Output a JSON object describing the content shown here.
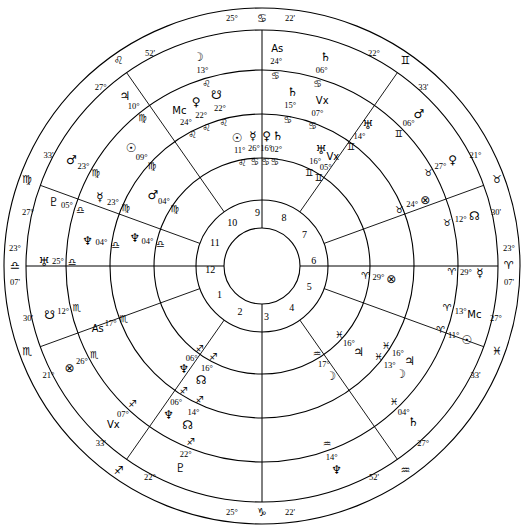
{
  "chart_data": {
    "type": "astrological-wheel",
    "structure": {
      "rings": [
        "outer-sign-ring",
        "outer-wheel",
        "middle-wheel",
        "inner-wheel",
        "house-number-ring",
        "center"
      ],
      "house_count": 12,
      "grid": false,
      "legend": "none"
    },
    "glyphs": {
      "aries": "♈",
      "taurus": "♉",
      "gemini": "♊",
      "cancer": "♋",
      "leo": "♌",
      "virgo": "♍",
      "libra": "♎",
      "scorpio": "♏",
      "sagittarius": "♐",
      "capricorn": "♑",
      "aquarius": "♒",
      "pisces": "♓",
      "sun": "☉",
      "moon": "☽",
      "mercury": "☿",
      "venus": "♀",
      "mars": "♂",
      "jupiter": "♃",
      "saturn": "♄",
      "uranus": "♅",
      "neptune": "♆",
      "pluto": "♇",
      "node_north": "☊",
      "node_south": "☋",
      "fortune": "⊗",
      "vertex": "Vx",
      "asc": "As",
      "mc": "Mc"
    },
    "angles": {
      "ascendant": {
        "label": "As",
        "deg": "25",
        "sign": "cancer",
        "min": "22'",
        "position": "top"
      },
      "descendant": {
        "deg": "23",
        "sign": "libra",
        "min": "07'",
        "position": "left"
      },
      "mc_outer": {
        "deg": "23",
        "sign": "aries",
        "min": "07'",
        "position": "right"
      },
      "ic": {
        "deg": "25",
        "sign": "capricorn",
        "min": "22'",
        "position": "bottom"
      }
    },
    "cusp_labels": [
      {
        "deg": "25",
        "sign": "cancer",
        "min": "22'",
        "angle_deg": 90
      },
      {
        "deg": "22",
        "sign": "gemini",
        "min": "33'",
        "angle_deg": 55
      },
      {
        "deg": "21",
        "sign": "taurus",
        "min": "30'",
        "angle_deg": 20
      },
      {
        "deg": "23",
        "sign": "aries",
        "min": "07'",
        "angle_deg": 0
      },
      {
        "deg": "27",
        "sign": "pisces",
        "min": "33'",
        "angle_deg": -20
      },
      {
        "deg": "27",
        "sign": "aquarius",
        "min": "52'",
        "angle_deg": -55
      },
      {
        "deg": "25",
        "sign": "capricorn",
        "min": "22'",
        "angle_deg": -90
      },
      {
        "deg": "22",
        "sign": "sagittarius",
        "min": "33'",
        "angle_deg": -125
      },
      {
        "deg": "21",
        "sign": "scorpio",
        "min": "30'",
        "angle_deg": -160
      },
      {
        "deg": "23",
        "sign": "libra",
        "min": "07'",
        "angle_deg": 180
      },
      {
        "deg": "27",
        "sign": "virgo",
        "min": "33'",
        "angle_deg": 160
      },
      {
        "deg": "27",
        "sign": "leo",
        "min": "52'",
        "angle_deg": 125
      }
    ],
    "house_numbers": [
      "1",
      "2",
      "3",
      "4",
      "5",
      "6",
      "7",
      "8",
      "9",
      "10",
      "11",
      "12"
    ],
    "outer_wheel": {
      "name": "outer wheel",
      "bodies": [
        {
          "planet": "asc",
          "deg": "24",
          "sign": "cancer",
          "angle_deg": 86
        },
        {
          "planet": "saturn",
          "deg": "06",
          "sign": "cancer",
          "angle_deg": 73
        },
        {
          "planet": "mars",
          "deg": "06",
          "sign": "gemini",
          "angle_deg": 44
        },
        {
          "planet": "venus",
          "deg": "27",
          "sign": "taurus",
          "angle_deg": 29
        },
        {
          "planet": "node_north",
          "deg": "12",
          "sign": "taurus",
          "angle_deg": 13
        },
        {
          "planet": "mercury",
          "deg": "29",
          "sign": "aries",
          "angle_deg": -2
        },
        {
          "planet": "mc",
          "deg": "13",
          "sign": "aries",
          "angle_deg": -13
        },
        {
          "planet": "sun",
          "deg": "11",
          "sign": "aries",
          "angle_deg": -20
        },
        {
          "planet": "saturn",
          "deg": "04",
          "sign": "pisces",
          "angle_deg": -46
        },
        {
          "planet": "neptune",
          "deg": "14",
          "sign": "aquarius",
          "angle_deg": -70
        },
        {
          "planet": "pluto",
          "deg": "22",
          "sign": "sagittarius",
          "angle_deg": -112
        },
        {
          "planet": "vertex",
          "deg": "07",
          "sign": "sagittarius",
          "angle_deg": -133
        },
        {
          "planet": "fortune",
          "deg": "26",
          "sign": "scorpio",
          "angle_deg": -152
        },
        {
          "planet": "node_south",
          "deg": "12",
          "sign": "scorpio",
          "angle_deg": -167
        },
        {
          "planet": "uranus",
          "deg": "25",
          "sign": "libra",
          "angle_deg": 179
        },
        {
          "planet": "pluto",
          "deg": "05",
          "sign": "libra",
          "angle_deg": 163
        },
        {
          "planet": "mars",
          "deg": "23",
          "sign": "virgo",
          "angle_deg": 151
        },
        {
          "planet": "jupiter",
          "deg": "10",
          "sign": "virgo",
          "angle_deg": 129
        },
        {
          "planet": "moon",
          "deg": "13",
          "sign": "leo",
          "angle_deg": 107
        }
      ]
    },
    "middle_wheel": {
      "name": "middle wheel",
      "bodies": [
        {
          "planet": "saturn",
          "deg": "15",
          "sign": "cancer",
          "angle_deg": 80
        },
        {
          "planet": "vertex",
          "deg": "07",
          "sign": "cancer",
          "angle_deg": 70
        },
        {
          "planet": "uranus",
          "deg": "14",
          "sign": "gemini",
          "angle_deg": 53
        },
        {
          "planet": "fortune",
          "deg": "24",
          "sign": "taurus",
          "angle_deg": 22
        },
        {
          "planet": "moon",
          "deg": "13",
          "sign": "pisces",
          "angle_deg": -38
        },
        {
          "planet": "jupiter",
          "deg": "16",
          "sign": "pisces",
          "angle_deg": -33
        },
        {
          "planet": "neptune",
          "deg": "06",
          "sign": "sagittarius",
          "angle_deg": -122
        },
        {
          "planet": "node_north",
          "deg": "14",
          "sign": "sagittarius",
          "angle_deg": -115
        },
        {
          "planet": "asc",
          "deg": "17",
          "sign": "scorpio",
          "angle_deg": -159
        },
        {
          "planet": "neptune",
          "deg": "04",
          "sign": "libra",
          "angle_deg": 172
        },
        {
          "planet": "mercury",
          "deg": "23",
          "sign": "virgo",
          "angle_deg": 157
        },
        {
          "planet": "sun",
          "deg": "09",
          "sign": "virgo",
          "angle_deg": 138
        },
        {
          "planet": "mc",
          "deg": "24",
          "sign": "leo",
          "angle_deg": 118
        },
        {
          "planet": "venus",
          "deg": "22",
          "sign": "leo",
          "angle_deg": 112
        },
        {
          "planet": "node_south",
          "deg": "22",
          "sign": "leo",
          "angle_deg": 105
        }
      ]
    },
    "inner_wheel": {
      "name": "inner wheel",
      "bodies": [
        {
          "planet": "sun",
          "deg": "11",
          "sign": "leo",
          "angle_deg": 101
        },
        {
          "planet": "mercury",
          "deg": "26",
          "sign": "cancer",
          "angle_deg": 94
        },
        {
          "planet": "venus",
          "deg": "16",
          "sign": "cancer",
          "angle_deg": 88
        },
        {
          "planet": "saturn",
          "deg": "02",
          "sign": "cancer",
          "angle_deg": 83
        },
        {
          "planet": "uranus",
          "deg": "16",
          "sign": "gemini",
          "angle_deg": 63
        },
        {
          "planet": "vertex",
          "deg": "05",
          "sign": "gemini",
          "angle_deg": 57
        },
        {
          "planet": "mars",
          "deg": "04",
          "sign": "virgo",
          "angle_deg": 147
        },
        {
          "planet": "neptune",
          "deg": "04",
          "sign": "libra",
          "angle_deg": 168
        },
        {
          "planet": "neptune",
          "deg": "06",
          "sign": "sagittarius",
          "angle_deg": -127
        },
        {
          "planet": "node_north",
          "deg": "16",
          "sign": "sagittarius",
          "angle_deg": -118
        },
        {
          "planet": "moon",
          "deg": "17",
          "sign": "aquarius",
          "angle_deg": -58
        },
        {
          "planet": "jupiter",
          "deg": "16",
          "sign": "pisces",
          "angle_deg": -42
        },
        {
          "planet": "fortune",
          "deg": "29",
          "sign": "aries",
          "angle_deg": -6
        }
      ]
    }
  }
}
